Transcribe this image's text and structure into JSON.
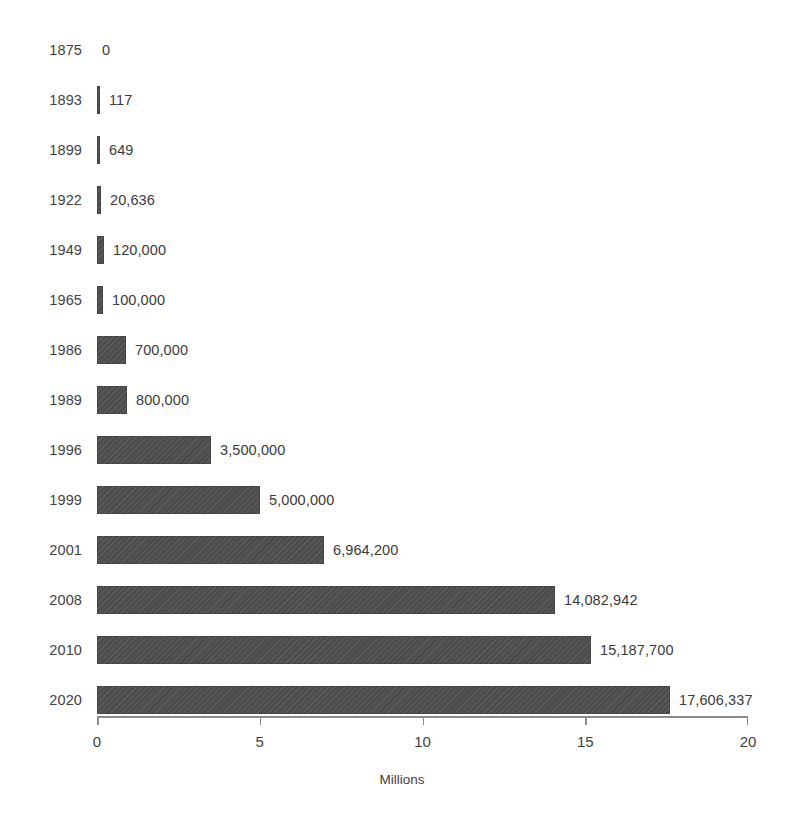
{
  "cropped_title": "",
  "chart_data": {
    "type": "bar",
    "orientation": "horizontal",
    "title": "",
    "xlabel": "Millions",
    "ylabel": "",
    "xlim": [
      0,
      20
    ],
    "x_unit_scale": 1000000,
    "grid": false,
    "legend": null,
    "xticks": [
      {
        "value": 0,
        "label": "0"
      },
      {
        "value": 5,
        "label": "5"
      },
      {
        "value": 10,
        "label": "10"
      },
      {
        "value": 15,
        "label": "15"
      },
      {
        "value": 20,
        "label": "20"
      }
    ],
    "categories": [
      "1875",
      "1893",
      "1899",
      "1922",
      "1949",
      "1965",
      "1986",
      "1989",
      "1996",
      "1999",
      "2001",
      "2008",
      "2010",
      "2020"
    ],
    "values": [
      0,
      117,
      649,
      20636,
      120000,
      100000,
      700000,
      800000,
      3500000,
      5000000,
      6964200,
      14082942,
      15187700,
      17606337
    ],
    "value_labels": [
      "0",
      "117",
      "649",
      "20,636",
      "120,000",
      "100,000",
      "700,000",
      "800,000",
      "3,500,000",
      "5,000,000",
      "6,964,200",
      "14,082,942",
      "15,187,700",
      "17,606,337"
    ],
    "bar_color": "#4d4d4d",
    "rows": [
      {
        "year": "1875",
        "value": 0,
        "label": "0",
        "px_width": 0
      },
      {
        "year": "1893",
        "value": 117,
        "label": "117",
        "px_width": 3
      },
      {
        "year": "1899",
        "value": 649,
        "label": "649",
        "px_width": 3
      },
      {
        "year": "1922",
        "value": 20636,
        "label": "20,636",
        "px_width": 4
      },
      {
        "year": "1949",
        "value": 120000,
        "label": "120,000",
        "px_width": 7
      },
      {
        "year": "1965",
        "value": 100000,
        "label": "100,000",
        "px_width": 6
      },
      {
        "year": "1986",
        "value": 700000,
        "label": "700,000",
        "px_width": 29
      },
      {
        "year": "1989",
        "value": 800000,
        "label": "800,000",
        "px_width": 30
      },
      {
        "year": "1996",
        "value": 3500000,
        "label": "3,500,000",
        "px_width": 114
      },
      {
        "year": "1999",
        "value": 5000000,
        "label": "5,000,000",
        "px_width": 163
      },
      {
        "year": "2001",
        "value": 6964200,
        "label": "6,964,200",
        "px_width": 227
      },
      {
        "year": "2008",
        "value": 14082942,
        "label": "14,082,942",
        "px_width": 458
      },
      {
        "year": "2010",
        "value": 15187700,
        "label": "15,187,700",
        "px_width": 494
      },
      {
        "year": "2020",
        "value": 17606337,
        "label": "17,606,337",
        "px_width": 573
      }
    ]
  }
}
